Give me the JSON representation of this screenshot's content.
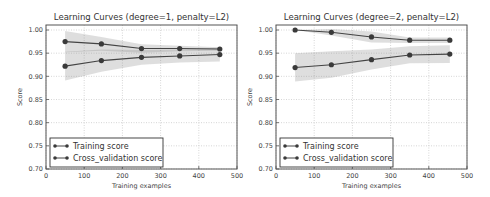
{
  "chart_data": [
    {
      "type": "line",
      "title": "Learning Curves (degree=1, penalty=L2)",
      "xlabel": "Training examples",
      "ylabel": "Score",
      "xlim": [
        0,
        500
      ],
      "ylim": [
        0.7,
        1.01
      ],
      "xticks": [
        "0",
        "100",
        "200",
        "300",
        "400",
        "500"
      ],
      "yticks": [
        "0.70",
        "0.75",
        "0.80",
        "0.85",
        "0.90",
        "0.95",
        "1.00"
      ],
      "grid": true,
      "legend_position": "lower left",
      "x": [
        50,
        145,
        250,
        350,
        455
      ],
      "series": [
        {
          "name": "Training score",
          "values": [
            0.975,
            0.97,
            0.96,
            0.96,
            0.959
          ],
          "band_low": [
            0.952,
            0.955,
            0.951,
            0.954,
            0.955
          ],
          "band_high": [
            0.998,
            0.985,
            0.969,
            0.966,
            0.963
          ]
        },
        {
          "name": "Cross_validation score",
          "values": [
            0.922,
            0.934,
            0.941,
            0.944,
            0.947
          ],
          "band_low": [
            0.891,
            0.91,
            0.925,
            0.93,
            0.932
          ],
          "band_high": [
            0.953,
            0.958,
            0.957,
            0.958,
            0.962
          ]
        }
      ]
    },
    {
      "type": "line",
      "title": "Learning Curves (degree=2, penalty=L2)",
      "xlabel": "Training examples",
      "ylabel": "Score",
      "xlim": [
        0,
        500
      ],
      "ylim": [
        0.7,
        1.01
      ],
      "xticks": [
        "0",
        "100",
        "200",
        "300",
        "400",
        "500"
      ],
      "yticks": [
        "0.70",
        "0.75",
        "0.80",
        "0.85",
        "0.90",
        "0.95",
        "1.00"
      ],
      "grid": true,
      "legend_position": "lower left",
      "x": [
        50,
        145,
        250,
        350,
        455
      ],
      "series": [
        {
          "name": "Training score",
          "values": [
            1.0,
            0.995,
            0.985,
            0.978,
            0.978
          ],
          "band_low": [
            1.0,
            0.988,
            0.973,
            0.972,
            0.972
          ],
          "band_high": [
            1.0,
            1.002,
            0.997,
            0.984,
            0.984
          ]
        },
        {
          "name": "Cross_validation score",
          "values": [
            0.919,
            0.925,
            0.936,
            0.946,
            0.948
          ],
          "band_low": [
            0.889,
            0.897,
            0.915,
            0.928,
            0.929
          ],
          "band_high": [
            0.95,
            0.954,
            0.958,
            0.965,
            0.967
          ]
        }
      ]
    }
  ]
}
